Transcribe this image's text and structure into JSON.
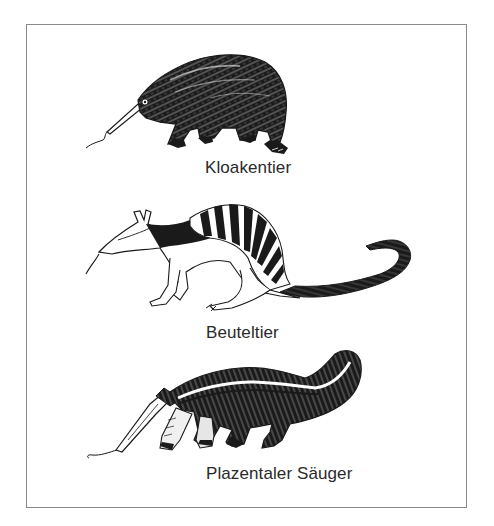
{
  "figure": {
    "panels": [
      {
        "id": "monotreme",
        "animal_icon": "echidna-illustration",
        "caption": "Kloakentier"
      },
      {
        "id": "marsupial",
        "animal_icon": "numbat-illustration",
        "caption": "Beuteltier"
      },
      {
        "id": "placental",
        "animal_icon": "anteater-illustration",
        "caption": "Plazentaler Säuger"
      }
    ]
  },
  "colors": {
    "ink": "#1a1a1a",
    "caption_text": "#2a2a2a",
    "frame_border": "#8a8a8a",
    "background": "#ffffff"
  }
}
